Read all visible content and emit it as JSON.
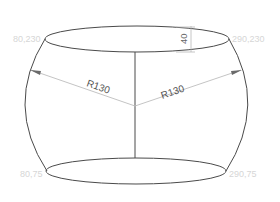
{
  "diagram": {
    "type": "technical-drawing",
    "coordinate_labels": {
      "top_left": "80,230",
      "top_right": "290,230",
      "bottom_left": "80,75",
      "bottom_right": "290,75"
    },
    "radius_labels": {
      "left": "R130",
      "right": "R130"
    },
    "dimension": {
      "height_label": "40"
    },
    "colors": {
      "outline": "#4a4a4a",
      "dimension_line": "#b8b8b8",
      "coordinate_text": "#d6d6d6",
      "label_text": "#555555",
      "background": "#ffffff"
    }
  }
}
